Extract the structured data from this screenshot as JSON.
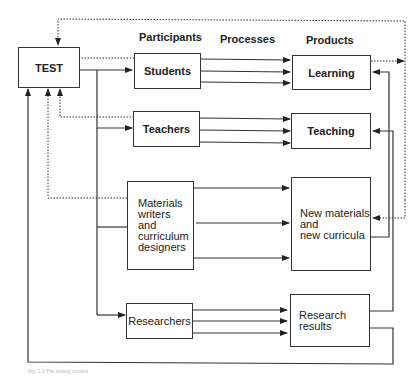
{
  "diagram": {
    "headers": {
      "participants": "Participants",
      "processes": "Processes",
      "products": "Products"
    },
    "nodes": {
      "test": "TEST",
      "students": "Students",
      "teachers": "Teachers",
      "materials_writers": [
        "Materials",
        "writers",
        "and",
        "curriculum",
        "designers"
      ],
      "researchers": "Researchers",
      "learning": "Learning",
      "teaching": "Teaching",
      "new_materials": [
        "New materials",
        "and",
        "new curricula"
      ],
      "research_results": [
        "Research",
        "results"
      ]
    },
    "edges": [
      {
        "from": "TEST",
        "to": "Students",
        "style": "solid"
      },
      {
        "from": "TEST",
        "to": "Teachers",
        "style": "solid"
      },
      {
        "from": "TEST",
        "to": "Materials writers and curriculum designers",
        "style": "solid"
      },
      {
        "from": "TEST",
        "to": "Researchers",
        "style": "solid"
      },
      {
        "from": "Students",
        "to": "TEST",
        "style": "dotted"
      },
      {
        "from": "Teachers",
        "to": "TEST",
        "style": "dotted"
      },
      {
        "from": "Materials writers and curriculum designers",
        "to": "TEST",
        "style": "dotted"
      },
      {
        "from": "Students",
        "to": "Learning",
        "style": "solid",
        "count": 3
      },
      {
        "from": "Teachers",
        "to": "Teaching",
        "style": "solid",
        "count": 3
      },
      {
        "from": "Materials writers and curriculum designers",
        "to": "New materials and new curricula",
        "style": "solid",
        "count": 3
      },
      {
        "from": "Researchers",
        "to": "Research results",
        "style": "solid",
        "count": 3
      },
      {
        "from": "Learning",
        "to": "TEST",
        "style": "dotted"
      },
      {
        "from": "Learning",
        "to": "New materials and new curricula",
        "style": "dotted"
      },
      {
        "from": "New materials and new curricula",
        "to": "Learning",
        "style": "solid"
      },
      {
        "from": "Research results",
        "to": "Teaching",
        "style": "solid"
      },
      {
        "from": "Research results",
        "to": "TEST",
        "style": "solid"
      }
    ],
    "caption": "Fig. 1.1 The testing context"
  }
}
